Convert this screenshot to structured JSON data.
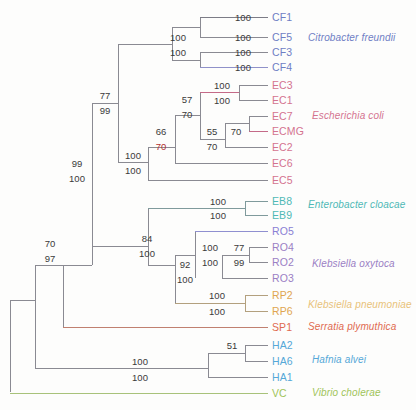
{
  "figure": {
    "type": "phylogenetic-tree",
    "background": "#fdfdfc",
    "branch_color": "#6b6b6b"
  },
  "taxa": [
    {
      "id": "CF1",
      "label": "CF1",
      "y": 17,
      "x": 272,
      "color": "#6f7ec4",
      "branch_color": "#7c7c86",
      "branch_x0": 228
    },
    {
      "id": "CF5",
      "label": "CF5",
      "y": 37,
      "x": 272,
      "color": "#6f7ec4",
      "branch_color": "#8a8a92",
      "branch_x0": 228
    },
    {
      "id": "CF3",
      "label": "CF3",
      "y": 52,
      "x": 272,
      "color": "#6f7ec4",
      "branch_color": "#8a8a92",
      "branch_x0": 228
    },
    {
      "id": "CF4",
      "label": "CF4",
      "y": 67,
      "x": 272,
      "color": "#6f7ec4",
      "branch_color": "#8f91c9",
      "branch_x0": 228
    },
    {
      "id": "EC3",
      "label": "EC3",
      "y": 85,
      "x": 272,
      "color": "#d4738f",
      "branch_color": "#8a8a92",
      "branch_x0": 239
    },
    {
      "id": "EC1",
      "label": "EC1",
      "y": 100,
      "x": 272,
      "color": "#d4738f",
      "branch_color": "#8a8a92",
      "branch_x0": 239
    },
    {
      "id": "EC7",
      "label": "EC7",
      "y": 116,
      "x": 272,
      "color": "#d4738f",
      "branch_color": "#8a8a92",
      "branch_x0": 249
    },
    {
      "id": "ECMG",
      "label": "ECMG",
      "y": 131,
      "x": 272,
      "color": "#d4738f",
      "branch_color": "#c46a88",
      "branch_x0": 249
    },
    {
      "id": "EC2",
      "label": "EC2",
      "y": 147,
      "x": 272,
      "color": "#d4738f",
      "branch_color": "#8a8a92",
      "branch_x0": 225
    },
    {
      "id": "EC6",
      "label": "EC6",
      "y": 163,
      "x": 272,
      "color": "#d4738f",
      "branch_color": "#8a8a92",
      "branch_x0": 175
    },
    {
      "id": "EC5",
      "label": "EC5",
      "y": 180,
      "x": 272,
      "color": "#d4738f",
      "branch_color": "#8a8a92",
      "branch_x0": 148
    },
    {
      "id": "EB8",
      "label": "EB8",
      "y": 201,
      "x": 272,
      "color": "#4fb9b6",
      "branch_color": "#7f9a9c",
      "branch_x0": 245
    },
    {
      "id": "EB9",
      "label": "EB9",
      "y": 215,
      "x": 272,
      "color": "#4fb9b6",
      "branch_color": "#7f9a9c",
      "branch_x0": 245
    },
    {
      "id": "RO5",
      "label": "RO5",
      "y": 231,
      "x": 272,
      "color": "#8a7fd4",
      "branch_color": "#8f8fd0",
      "branch_x0": 222
    },
    {
      "id": "RO4",
      "label": "RO4",
      "y": 247,
      "x": 272,
      "color": "#9b7fc4",
      "branch_color": "#8a8a92",
      "branch_x0": 249
    },
    {
      "id": "RO2",
      "label": "RO2",
      "y": 262,
      "x": 272,
      "color": "#9b7fc4",
      "branch_color": "#8a8a92",
      "branch_x0": 249
    },
    {
      "id": "RO3",
      "label": "RO3",
      "y": 278,
      "x": 272,
      "color": "#9b7fc4",
      "branch_color": "#8a8a92",
      "branch_x0": 222
    },
    {
      "id": "RP2",
      "label": "RP2",
      "y": 295,
      "x": 272,
      "color": "#e0a550",
      "branch_color": "#b3a07e",
      "branch_x0": 245
    },
    {
      "id": "RP6",
      "label": "RP6",
      "y": 311,
      "x": 272,
      "color": "#e0a550",
      "branch_color": "#b3a07e",
      "branch_x0": 245
    },
    {
      "id": "SP1",
      "label": "SP1",
      "y": 327,
      "x": 272,
      "color": "#e06a50",
      "branch_color": "#c08070",
      "branch_x0": 63
    },
    {
      "id": "HA2",
      "label": "HA2",
      "y": 345,
      "x": 272,
      "color": "#55a8d8",
      "branch_color": "#8a8a92",
      "branch_x0": 245
    },
    {
      "id": "HA6",
      "label": "HA6",
      "y": 361,
      "x": 272,
      "color": "#55a8d8",
      "branch_color": "#8a8a92",
      "branch_x0": 245
    },
    {
      "id": "HA1",
      "label": "HA1",
      "y": 377,
      "x": 272,
      "color": "#55a8d8",
      "branch_color": "#8a8a92",
      "branch_x0": 208
    },
    {
      "id": "VC",
      "label": "VC",
      "y": 393,
      "x": 272,
      "color": "#9fc45a",
      "branch_color": "#a8c27a",
      "branch_x0": 10
    }
  ],
  "species_labels": [
    {
      "name": "Citrobacter freundii",
      "x": 308,
      "y": 38,
      "color": "#6f7ec4"
    },
    {
      "name": "Escherichia coli",
      "x": 312,
      "y": 116,
      "color": "#d4738f"
    },
    {
      "name": "Enterobacter cloacae",
      "x": 308,
      "y": 205,
      "color": "#4fb9b6"
    },
    {
      "name": "Klebsiella oxytoca",
      "x": 312,
      "y": 264,
      "color": "#9b7fc4"
    },
    {
      "name": "Klebsiella pneumoniae",
      "x": 308,
      "y": 305,
      "color": "#e8c27a"
    },
    {
      "name": "Serratia plymuthica",
      "x": 308,
      "y": 327,
      "color": "#e06a50"
    },
    {
      "name": "Hafnia alvei",
      "x": 312,
      "y": 360,
      "color": "#55a8d8"
    },
    {
      "name": "Vibrio cholerae",
      "x": 312,
      "y": 393,
      "color": "#9fc45a"
    }
  ],
  "bootstrap_labels": [
    {
      "value": "100",
      "x": 243,
      "y": 17,
      "red": false
    },
    {
      "value": "100",
      "x": 243,
      "y": 37,
      "red": false
    },
    {
      "value": "100",
      "x": 243,
      "y": 52,
      "red": false
    },
    {
      "value": "100",
      "x": 243,
      "y": 67,
      "red": false
    },
    {
      "value": "100",
      "x": 178,
      "y": 37,
      "red": false
    },
    {
      "value": "100",
      "x": 178,
      "y": 52,
      "red": false
    },
    {
      "value": "100",
      "x": 222,
      "y": 85,
      "red": false
    },
    {
      "value": "100",
      "x": 222,
      "y": 100,
      "red": false
    },
    {
      "value": "57",
      "x": 187,
      "y": 99,
      "red": false
    },
    {
      "value": "70",
      "x": 187,
      "y": 114,
      "red": false
    },
    {
      "value": "55",
      "x": 212,
      "y": 131,
      "red": false
    },
    {
      "value": "70",
      "x": 212,
      "y": 146,
      "red": false
    },
    {
      "value": "70",
      "x": 236,
      "y": 131,
      "red": false
    },
    {
      "value": "66",
      "x": 161,
      "y": 131,
      "red": false
    },
    {
      "value": "70",
      "x": 161,
      "y": 146,
      "red": true
    },
    {
      "value": "100",
      "x": 133,
      "y": 155,
      "red": false
    },
    {
      "value": "100",
      "x": 133,
      "y": 170,
      "red": false
    },
    {
      "value": "77",
      "x": 105,
      "y": 95,
      "red": false
    },
    {
      "value": "99",
      "x": 105,
      "y": 110,
      "red": false
    },
    {
      "value": "99",
      "x": 77,
      "y": 163,
      "red": false
    },
    {
      "value": "100",
      "x": 77,
      "y": 178,
      "red": false
    },
    {
      "value": "100",
      "x": 218,
      "y": 201,
      "red": false
    },
    {
      "value": "100",
      "x": 218,
      "y": 215,
      "red": false
    },
    {
      "value": "100",
      "x": 210,
      "y": 247,
      "red": false
    },
    {
      "value": "100",
      "x": 210,
      "y": 262,
      "red": false
    },
    {
      "value": "77",
      "x": 239,
      "y": 247,
      "red": false
    },
    {
      "value": "99",
      "x": 239,
      "y": 262,
      "red": false
    },
    {
      "value": "92",
      "x": 185,
      "y": 264,
      "red": false
    },
    {
      "value": "100",
      "x": 185,
      "y": 279,
      "red": false
    },
    {
      "value": "100",
      "x": 217,
      "y": 295,
      "red": false
    },
    {
      "value": "100",
      "x": 217,
      "y": 311,
      "red": false
    },
    {
      "value": "84",
      "x": 147,
      "y": 238,
      "red": false
    },
    {
      "value": "100",
      "x": 147,
      "y": 253,
      "red": false
    },
    {
      "value": "70",
      "x": 50,
      "y": 243,
      "red": false
    },
    {
      "value": "97",
      "x": 50,
      "y": 258,
      "red": false
    },
    {
      "value": "51",
      "x": 232,
      "y": 345,
      "red": false
    },
    {
      "value": "100",
      "x": 140,
      "y": 361,
      "red": false
    },
    {
      "value": "100",
      "x": 140,
      "y": 377,
      "red": false
    }
  ],
  "branches": [
    {
      "name": "root-stem",
      "d": "M 10,392 L 10,300",
      "color": "#8a8a92"
    },
    {
      "name": "root-to-vc",
      "d": "M 10,393 L 268,393",
      "color": "#a8c27a"
    },
    {
      "name": "node97-vert",
      "d": "M 35,300 L 35,368",
      "color": "#8a8a92"
    },
    {
      "name": "node97-stem",
      "d": "M 10,300 L 35,300",
      "color": "#8a8a92"
    },
    {
      "name": "node97-up",
      "d": "M 35,300 L 35,265",
      "color": "#8a8a92"
    },
    {
      "name": "node97-to-ha",
      "d": "M 35,368 L 208,368",
      "color": "#8a8a92"
    },
    {
      "name": "node70-vert",
      "d": "M 63,265 L 63,327",
      "color": "#8a8a92"
    },
    {
      "name": "node70-stem",
      "d": "M 35,265 L 63,265",
      "color": "#8a8a92"
    },
    {
      "name": "node70-to-sp1",
      "d": "M 63,327 L 268,327",
      "color": "#c08070"
    },
    {
      "name": "node99-vert",
      "d": "M 92,171 L 92,265",
      "color": "#8a8a92"
    },
    {
      "name": "node99-stem",
      "d": "M 63,265 L 92,265",
      "color": "#8a8a92"
    },
    {
      "name": "node99-up",
      "d": "M 92,171 L 92,103",
      "color": "#8a8a92"
    },
    {
      "name": "node84-vert",
      "d": "M 148,208 L 148,265",
      "color": "#8a8a92"
    },
    {
      "name": "node84-stem",
      "d": "M 92,246 L 148,246",
      "color": "#8a8a92"
    },
    {
      "name": "node77-vert",
      "d": "M 118,103 L 118,162",
      "color": "#8a8a92"
    },
    {
      "name": "node77-stem",
      "d": "M 92,103 L 118,103",
      "color": "#8a8a92"
    },
    {
      "name": "node77-top",
      "d": "M 118,44 L 118,103",
      "color": "#8a8a92"
    },
    {
      "name": "node100cf-stem",
      "d": "M 118,44 L 172,44",
      "color": "#8a8a92"
    },
    {
      "name": "cf-vert",
      "d": "M 172,27 L 172,60",
      "color": "#8a8a92"
    },
    {
      "name": "cf15-vert",
      "d": "M 200,17 L 200,37",
      "color": "#8a8a92"
    },
    {
      "name": "cf15-stem",
      "d": "M 172,27 L 200,27",
      "color": "#8a8a92"
    },
    {
      "name": "cf1-tip",
      "d": "M 200,17 L 268,17",
      "color": "#7c7c86"
    },
    {
      "name": "cf5-tip",
      "d": "M 200,37 L 268,37",
      "color": "#8a8a92"
    },
    {
      "name": "cf34-vert",
      "d": "M 200,52 L 200,67",
      "color": "#8a8a92"
    },
    {
      "name": "cf34-stem",
      "d": "M 172,60 L 200,60",
      "color": "#8a8a92"
    },
    {
      "name": "cf3-tip",
      "d": "M 200,52 L 268,52",
      "color": "#8a8a92"
    },
    {
      "name": "cf4-tip",
      "d": "M 200,67 L 268,67",
      "color": "#8f91c9"
    },
    {
      "name": "ec-main-vert",
      "d": "M 148,147 L 148,180",
      "color": "#8a8a92"
    },
    {
      "name": "ec-main-stem",
      "d": "M 118,162 L 148,162",
      "color": "#8a8a92"
    },
    {
      "name": "ec5-tip",
      "d": "M 148,180 L 268,180",
      "color": "#8a8a92"
    },
    {
      "name": "node66-vert",
      "d": "M 175,115 L 175,163",
      "color": "#8a8a92"
    },
    {
      "name": "node66-stem",
      "d": "M 148,147 L 175,147",
      "color": "#8a8a92"
    },
    {
      "name": "ec6-tip",
      "d": "M 175,163 L 268,163",
      "color": "#8a8a92"
    },
    {
      "name": "node57-vert",
      "d": "M 200,92 L 200,139",
      "color": "#8a8a92"
    },
    {
      "name": "node57-stem",
      "d": "M 175,115 L 200,115",
      "color": "#8a8a92"
    },
    {
      "name": "node100ec31-stem",
      "d": "M 200,92 L 239,92",
      "color": "#c46a88"
    },
    {
      "name": "ec31-vert",
      "d": "M 239,85 L 239,100",
      "color": "#8a8a92"
    },
    {
      "name": "ec3-tip",
      "d": "M 239,85 L 268,85",
      "color": "#8a8a92"
    },
    {
      "name": "ec1-tip",
      "d": "M 239,100 L 268,100",
      "color": "#8a8a92"
    },
    {
      "name": "node55-vert",
      "d": "M 225,123 L 225,147",
      "color": "#8a8a92"
    },
    {
      "name": "node55-stem",
      "d": "M 200,139 L 225,139",
      "color": "#8a8a92"
    },
    {
      "name": "ec2-tip",
      "d": "M 225,147 L 268,147",
      "color": "#8a8a92"
    },
    {
      "name": "node70ec-vert",
      "d": "M 249,116 L 249,131",
      "color": "#8a8a92"
    },
    {
      "name": "node70ec-stem",
      "d": "M 225,123 L 249,123",
      "color": "#8a8a92"
    },
    {
      "name": "ec7-tip",
      "d": "M 249,116 L 268,116",
      "color": "#8a8a92"
    },
    {
      "name": "ecmg-tip",
      "d": "M 249,131 L 268,131",
      "color": "#c46a88"
    },
    {
      "name": "eb-stem",
      "d": "M 148,208 L 245,208",
      "color": "#7f9a9c"
    },
    {
      "name": "eb-vert",
      "d": "M 245,201 L 245,215",
      "color": "#7f9a9c"
    },
    {
      "name": "eb8-tip",
      "d": "M 245,201 L 268,201",
      "color": "#7f9a9c"
    },
    {
      "name": "eb9-tip",
      "d": "M 245,215 L 268,215",
      "color": "#7f9a9c"
    },
    {
      "name": "node92-vert",
      "d": "M 175,255 L 175,303",
      "color": "#8a8a92"
    },
    {
      "name": "node92-stem",
      "d": "M 148,265 L 175,265",
      "color": "#8a8a92"
    },
    {
      "name": "ro-vert",
      "d": "M 195,231 L 195,278",
      "color": "#8a8a92"
    },
    {
      "name": "ro-stem",
      "d": "M 175,255 L 195,255",
      "color": "#8a8a92"
    },
    {
      "name": "ro5-tip",
      "d": "M 195,231 L 268,231",
      "color": "#8f8fd0"
    },
    {
      "name": "ro-inner-vert",
      "d": "M 222,255 L 222,278",
      "color": "#8a8a92"
    },
    {
      "name": "ro3-tip",
      "d": "M 222,278 L 268,278",
      "color": "#8a8a92"
    },
    {
      "name": "ro42-vert",
      "d": "M 249,247 L 249,262",
      "color": "#8a8a92"
    },
    {
      "name": "ro42-stem",
      "d": "M 222,255 L 249,255",
      "color": "#8a8a92"
    },
    {
      "name": "ro4-tip",
      "d": "M 249,247 L 268,247",
      "color": "#8a8a92"
    },
    {
      "name": "ro2-tip",
      "d": "M 249,262 L 268,262",
      "color": "#8a8a92"
    },
    {
      "name": "rp-stem",
      "d": "M 175,303 L 245,303",
      "color": "#b3a07e"
    },
    {
      "name": "rp-vert",
      "d": "M 245,295 L 245,311",
      "color": "#b3a07e"
    },
    {
      "name": "rp2-tip",
      "d": "M 245,295 L 268,295",
      "color": "#b3a07e"
    },
    {
      "name": "rp6-tip",
      "d": "M 245,311 L 268,311",
      "color": "#b3a07e"
    },
    {
      "name": "ha-vert",
      "d": "M 208,353 L 208,377",
      "color": "#8a8a92"
    },
    {
      "name": "ha1-tip",
      "d": "M 208,377 L 268,377",
      "color": "#8a8a92"
    },
    {
      "name": "ha26-vert",
      "d": "M 245,345 L 245,361",
      "color": "#8a8a92"
    },
    {
      "name": "ha26-stem",
      "d": "M 208,353 L 245,353",
      "color": "#8a8a92"
    },
    {
      "name": "ha2-tip",
      "d": "M 245,345 L 268,345",
      "color": "#8a8a92"
    },
    {
      "name": "ha6-tip",
      "d": "M 245,361 L 268,361",
      "color": "#8a8a92"
    }
  ]
}
